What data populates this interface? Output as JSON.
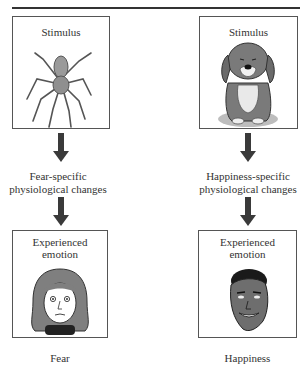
{
  "columns": [
    {
      "id": "fear",
      "stimulus": {
        "title": "Stimulus",
        "image": "spider-icon"
      },
      "physiology_label": [
        "Fear-specific",
        "physiological changes"
      ],
      "experience": {
        "title": [
          "Experienced",
          "emotion"
        ],
        "image": "frightened-woman-face-icon"
      },
      "caption": "Fear"
    },
    {
      "id": "happiness",
      "stimulus": {
        "title": "Stimulus",
        "image": "dog-icon"
      },
      "physiology_label": [
        "Happiness-specific",
        "physiological changes"
      ],
      "experience": {
        "title": [
          "Experienced",
          "emotion"
        ],
        "image": "smiling-man-face-icon"
      },
      "caption": "Happiness"
    }
  ],
  "colors": {
    "arrow": "#3a3a3a",
    "border": "#555555",
    "fill_gray": "#8a8a8a"
  }
}
